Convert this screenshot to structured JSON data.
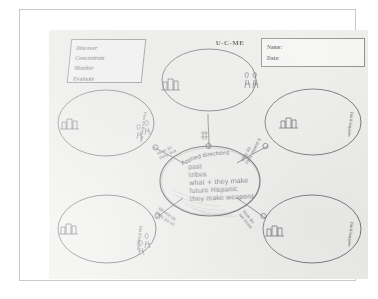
{
  "document": {
    "kind": "scanned-worksheet",
    "title": "U-C-ME",
    "paper_color": "#f0f0ee",
    "ink_color": "#5d5d63",
    "print_color": "#6a6a6a"
  },
  "legend": {
    "items": [
      {
        "label": "Discover"
      },
      {
        "label": "Concentrate"
      },
      {
        "label": "Monitor"
      },
      {
        "label": "Evaluate"
      }
    ]
  },
  "name_box": {
    "name_label": "Name:",
    "name_value": "",
    "date_label": "Date:",
    "date_value": ""
  },
  "center_node": {
    "arc_label": "Applied directions",
    "lines": [
      "past",
      "tribes",
      "what + they make",
      "future Hispanic",
      "they make weapons"
    ]
  },
  "spokes": [
    {
      "position": "top",
      "label": "",
      "node_text": ""
    },
    {
      "position": "upper-left",
      "label_line1": "How do",
      "label_line2": "they live",
      "node_text": ""
    },
    {
      "position": "upper-right",
      "label_line1": "Why do",
      "label_line2": "they repeat it",
      "node_text": ""
    },
    {
      "position": "lower-left",
      "label_line1": "Where do",
      "label_line2": "they go on",
      "node_text": ""
    },
    {
      "position": "lower-right",
      "label_line1": "How do",
      "label_line2": "we know",
      "node_text": ""
    }
  ],
  "side_notes": [
    {
      "position": "upper-left-outer",
      "text": "How do they live"
    },
    {
      "position": "upper-right-outer",
      "text": "Did it happen"
    },
    {
      "position": "lower-left-outer",
      "text": "Did it happen"
    },
    {
      "position": "lower-right-outer",
      "text": "Did it happen"
    }
  ],
  "nodes": [
    {
      "name": "top-oval",
      "content": ""
    },
    {
      "name": "left-upper-oval",
      "content": ""
    },
    {
      "name": "right-upper-oval",
      "content": ""
    },
    {
      "name": "left-lower-oval",
      "content": ""
    },
    {
      "name": "right-lower-oval",
      "content": ""
    },
    {
      "name": "center-oval",
      "content": "past tribes what + they make future Hispanic they make weapons"
    }
  ]
}
